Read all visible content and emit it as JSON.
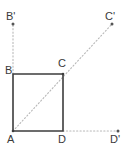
{
  "figure": {
    "type": "geometry-diagram",
    "width": 126,
    "height": 147,
    "colors": {
      "square_stroke": "#3d3d3d",
      "dotted_stroke": "#b8b8b8",
      "point_marker": "#555555",
      "label_text": "#3a3a3a",
      "background": "#ffffff"
    },
    "square": {
      "name": "ABCD",
      "stroke_width": 1.6,
      "vertices": [
        {
          "id": "A",
          "x": 13,
          "y": 131
        },
        {
          "id": "B",
          "x": 13,
          "y": 74
        },
        {
          "id": "C",
          "x": 63,
          "y": 74
        },
        {
          "id": "D",
          "x": 63,
          "y": 131
        }
      ]
    },
    "image_points": [
      {
        "id": "Bp",
        "x": 13,
        "y": 24
      },
      {
        "id": "Cp",
        "x": 112,
        "y": 24
      },
      {
        "id": "Dp",
        "x": 118,
        "y": 131
      }
    ],
    "dotted_lines": [
      {
        "id": "ray-A-to-Cp",
        "x1": 13,
        "y1": 131,
        "x2": 112,
        "y2": 24
      },
      {
        "id": "ray-B-to-Bp",
        "x1": 13,
        "y1": 74,
        "x2": 13,
        "y2": 24
      },
      {
        "id": "ray-D-to-Dp",
        "x1": 63,
        "y1": 131,
        "x2": 118,
        "y2": 131
      }
    ],
    "labels": [
      {
        "id": "B-prime",
        "text": "B'",
        "x": 6,
        "y": 11
      },
      {
        "id": "C-prime",
        "text": "C'",
        "x": 105,
        "y": 11
      },
      {
        "id": "B",
        "text": "B",
        "x": 5,
        "y": 65
      },
      {
        "id": "C",
        "text": "C",
        "x": 58,
        "y": 58
      },
      {
        "id": "A",
        "text": "A",
        "x": 7,
        "y": 134
      },
      {
        "id": "D",
        "text": "D",
        "x": 58,
        "y": 134
      },
      {
        "id": "D-prime",
        "text": "D'",
        "x": 110,
        "y": 134
      }
    ]
  }
}
